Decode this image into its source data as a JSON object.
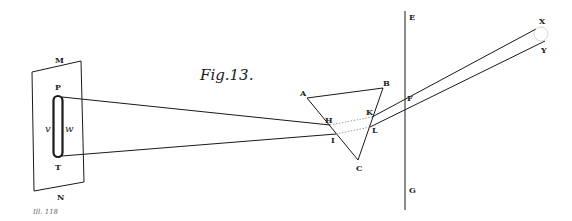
{
  "figure": {
    "title": "Fig.13.",
    "caption": "Ill. 118",
    "labels": {
      "M": "M",
      "N": "N",
      "P": "P",
      "T": "T",
      "v": "v",
      "w": "w",
      "A": "A",
      "B": "B",
      "C": "C",
      "H": "H",
      "I": "I",
      "K": "K",
      "L": "L",
      "E": "E",
      "F": "F",
      "G": "G",
      "X": "X",
      "Y": "Y"
    },
    "colors": {
      "ink": "#1a1a1a",
      "paper": "#ffffff",
      "caption": "#666666"
    }
  }
}
